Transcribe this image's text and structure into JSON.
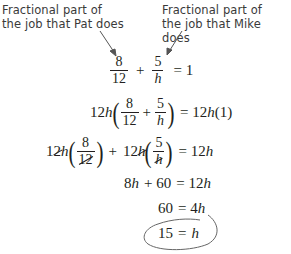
{
  "annotations": {
    "left_label": [
      "Fractional part of",
      "the job that Pat does"
    ],
    "right_label": [
      "Fractional part of",
      "the job that Mike does"
    ]
  },
  "equations": {
    "eq1": {
      "f1_num": "8",
      "f1_den": "12",
      "plus": "+",
      "f2_num": "5",
      "f2_den": "h",
      "rhs": "= 1"
    },
    "eq2": {
      "coef": "12",
      "var": "h",
      "f1_num": "8",
      "f1_den": "12",
      "plus": "+",
      "f2_num": "5",
      "f2_den": "h",
      "rhs_eq": "= 12",
      "rhs_var": "h",
      "rhs_tail": "(1)"
    },
    "eq3": {
      "coef1_a": "1",
      "coef1_b": "2",
      "var1": "h",
      "f1_num": "8",
      "f1_den": "12",
      "plus": "+",
      "coef2": "12",
      "var2": "h",
      "f2_num": "5",
      "f2_den": "h",
      "rhs_eq": "= 12",
      "rhs_var": "h"
    },
    "eq4": {
      "lhs_a": "8",
      "lhs_var": "h",
      "lhs_b": "+ 60",
      "rhs_eq": "= 12",
      "rhs_var": "h"
    },
    "eq5": {
      "lhs": "60",
      "rhs_eq": "= 4",
      "rhs_var": "h"
    },
    "eq6": {
      "lhs": "15",
      "rhs_eq": "=",
      "rhs_var": "h"
    }
  },
  "colors": {
    "text": "#231f20",
    "label": "#3a3a3a",
    "arrow": "#555555",
    "circle": "#666666"
  }
}
